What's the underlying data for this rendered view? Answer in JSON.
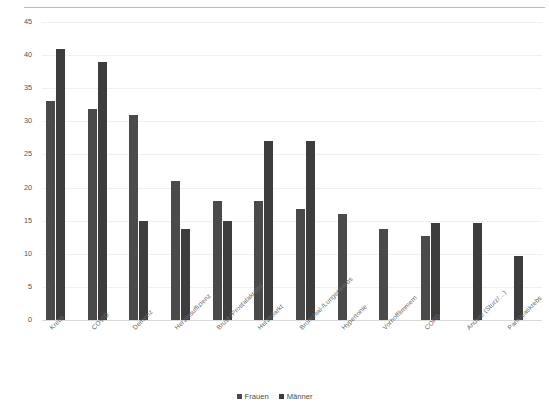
{
  "chart_data": {
    "type": "bar",
    "title": "",
    "subtitle": "",
    "xlabel": "",
    "ylabel": "",
    "ylim": [
      0,
      45
    ],
    "yticks": [
      0,
      5,
      10,
      15,
      20,
      25,
      30,
      35,
      40,
      45
    ],
    "grid": true,
    "legend_position": "bottom",
    "categories": [
      "Krebs",
      "COVID",
      "Demenz",
      "Herzinsuffizienz",
      "Brust-/Prostatakrebs",
      "Herzinfarkt",
      "Bronchial-/Lungenkrebs",
      "Hypertonie",
      "Vorhofflimmern",
      "COPD",
      "Andere (Sturz/&#8230;)",
      "Pankreaskrebs"
    ],
    "series": [
      {
        "name": "Frauen",
        "color": "#4a4a4a",
        "values": [
          33,
          31.8,
          31,
          21,
          18,
          18,
          16.7,
          16,
          13.7,
          12.7,
          null,
          null
        ]
      },
      {
        "name": "Männer",
        "color": "#3d3d3d",
        "values": [
          41,
          39,
          15,
          13.8,
          15,
          27,
          27,
          null,
          null,
          14.7,
          14.6,
          9.7
        ]
      }
    ]
  },
  "legend": {
    "items": [
      {
        "label": "Frauen",
        "color": "#4a4a4a"
      },
      {
        "label": "Männer",
        "color": "#3d3d3d"
      }
    ]
  },
  "axis": {
    "y_labels": [
      "45",
      "40",
      "35",
      "30",
      "25",
      "20",
      "15",
      "10",
      "5",
      "0"
    ]
  }
}
